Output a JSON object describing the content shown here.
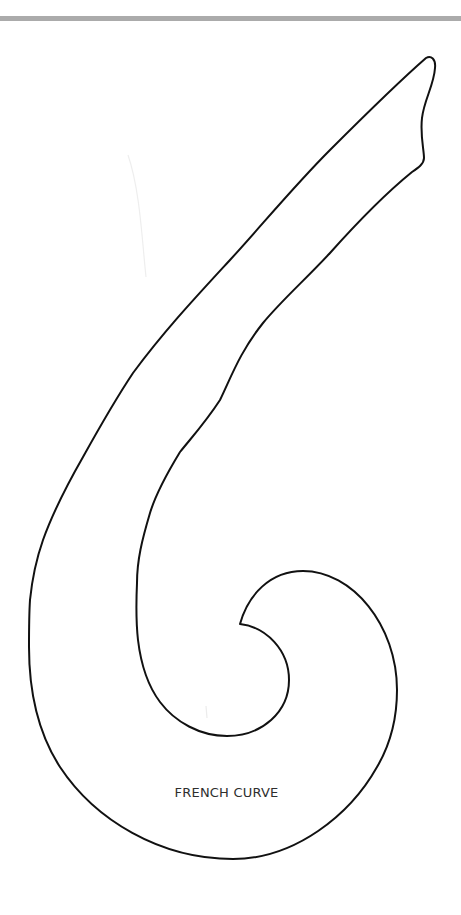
{
  "page": {
    "background": "#ffffff",
    "top_rule_color": "#ababab"
  },
  "template": {
    "shape_name": "french-curve",
    "label": "FRENCH CURVE",
    "outline_color": "#111111",
    "label_color": "#2e2e2e"
  }
}
